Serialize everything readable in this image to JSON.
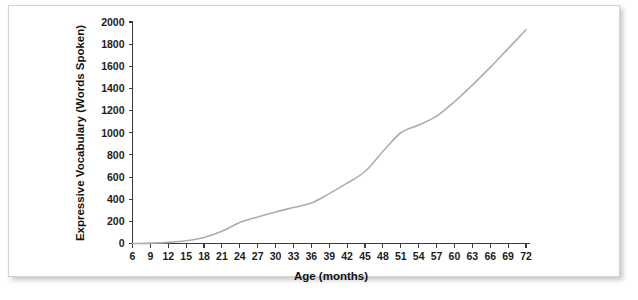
{
  "figure": {
    "background_color": "#ffffff",
    "frame_border_color": "#d2d2d2"
  },
  "chart_data": {
    "type": "line",
    "title": "",
    "xlabel": "Age (months)",
    "ylabel": "Expressive Vocabulary (Words Spoken)",
    "xlim": [
      6,
      72
    ],
    "ylim": [
      0,
      2000
    ],
    "grid": false,
    "legend": false,
    "line_color": "#adadad",
    "x_ticks": [
      6,
      9,
      12,
      15,
      18,
      21,
      24,
      27,
      30,
      33,
      36,
      39,
      42,
      45,
      48,
      51,
      54,
      57,
      60,
      63,
      66,
      69,
      72
    ],
    "y_ticks": [
      0,
      200,
      400,
      600,
      800,
      1000,
      1200,
      1400,
      1600,
      1800,
      2000
    ],
    "x_tick_labels": [
      "6",
      "9",
      "12",
      "15",
      "18",
      "21",
      "24",
      "27",
      "30",
      "33",
      "36",
      "39",
      "42",
      "45",
      "48",
      "51",
      "54",
      "57",
      "60",
      "63",
      "66",
      "69",
      "72"
    ],
    "y_tick_labels": [
      "0",
      "200",
      "400",
      "600",
      "800",
      "1000",
      "1200",
      "1400",
      "1600",
      "1800",
      "2000"
    ],
    "x": [
      6,
      9,
      12,
      15,
      18,
      21,
      24,
      27,
      30,
      33,
      36,
      39,
      42,
      45,
      48,
      51,
      54,
      57,
      60,
      63,
      66,
      69,
      72
    ],
    "values": [
      0,
      3,
      10,
      25,
      55,
      110,
      190,
      240,
      285,
      325,
      365,
      450,
      545,
      650,
      830,
      1000,
      1070,
      1150,
      1280,
      1430,
      1590,
      1760,
      1930
    ],
    "series": [
      {
        "name": "Expressive Vocabulary",
        "values": [
          0,
          3,
          10,
          25,
          55,
          110,
          190,
          240,
          285,
          325,
          365,
          450,
          545,
          650,
          830,
          1000,
          1070,
          1150,
          1280,
          1430,
          1590,
          1760,
          1930
        ]
      }
    ]
  }
}
